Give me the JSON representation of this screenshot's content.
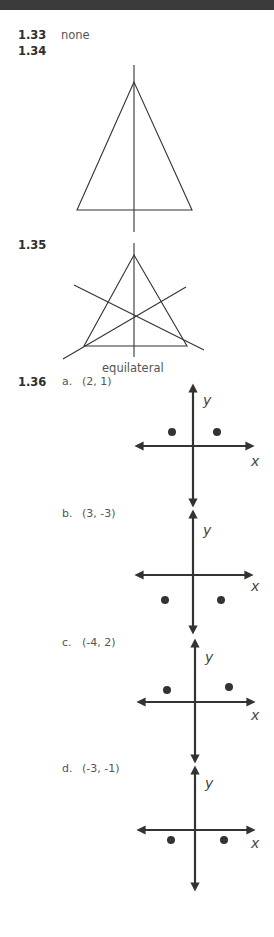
{
  "problems": [
    {
      "number": "1.33",
      "answer": "none"
    },
    {
      "number": "1.34",
      "figure": "isosceles-triangle-with-one-line-of-symmetry"
    },
    {
      "number": "1.35",
      "figure": "equilateral-triangle-with-three-lines-of-symmetry",
      "caption": "equilateral"
    },
    {
      "number": "1.36",
      "parts": [
        {
          "label": "a.",
          "point": "(2, 1)",
          "axis_labels": {
            "x": "x",
            "y": "y"
          }
        },
        {
          "label": "b.",
          "point": "(3, -3)",
          "axis_labels": {
            "x": "x",
            "y": "y"
          }
        },
        {
          "label": "c.",
          "point": "(-4, 2)",
          "axis_labels": {
            "x": "x",
            "y": "y"
          }
        },
        {
          "label": "d.",
          "point": "(-3, -1)",
          "axis_labels": {
            "x": "x",
            "y": "y"
          }
        }
      ]
    }
  ],
  "colors": {
    "topbar": "#3b3b3b",
    "ink": "#333333",
    "text": "#555555"
  }
}
